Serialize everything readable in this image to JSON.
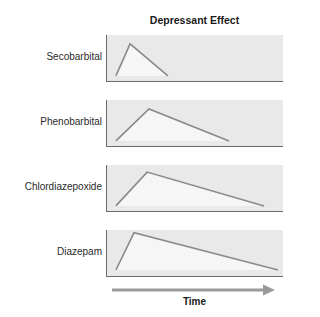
{
  "chart_data": {
    "type": "line",
    "title": "Depressant Effect",
    "xlabel": "Time",
    "ylabel": "",
    "layout": {
      "panels": "small multiples, stacked vertically",
      "grid": false,
      "legend": "none; row labels on left",
      "x_axis": "shared Time arrow at bottom, no ticks",
      "y_axis": "no ticks"
    },
    "xlim": [
      0,
      100
    ],
    "ylim": [
      0,
      100
    ],
    "series": [
      {
        "name": "Secobarbital",
        "points": [
          {
            "x": 5.6,
            "y": 13
          },
          {
            "x": 13.6,
            "y": 81
          },
          {
            "x": 35,
            "y": 13
          }
        ]
      },
      {
        "name": "Phenobarbital",
        "points": [
          {
            "x": 5.6,
            "y": 13
          },
          {
            "x": 24.3,
            "y": 81
          },
          {
            "x": 69.5,
            "y": 13
          }
        ]
      },
      {
        "name": "Chlordiazepoxide",
        "points": [
          {
            "x": 5.6,
            "y": 13
          },
          {
            "x": 23.2,
            "y": 85
          },
          {
            "x": 89.3,
            "y": 13
          }
        ]
      },
      {
        "name": "Diazepam",
        "points": [
          {
            "x": 5.6,
            "y": 15
          },
          {
            "x": 15.8,
            "y": 94
          },
          {
            "x": 97.2,
            "y": 15
          }
        ]
      }
    ]
  },
  "colors": {
    "panel_background": "#e9e9e9",
    "curve_fill": "#f6f6f6",
    "curve_line": "#8a8a8a",
    "axis": "#6a6a6a",
    "arrow": "#9a9a9a"
  }
}
